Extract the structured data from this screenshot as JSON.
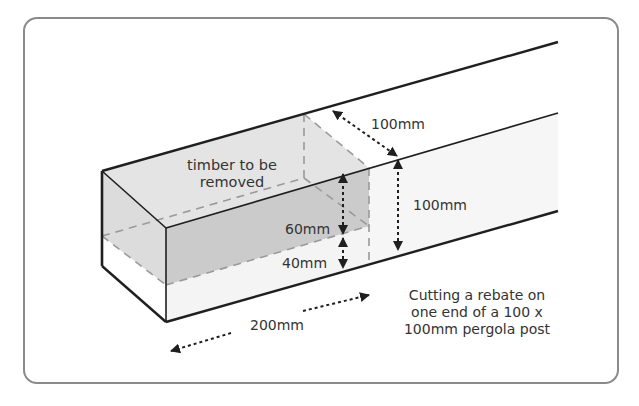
{
  "diagram": {
    "labels": {
      "removed": [
        "timber to be",
        "removed"
      ],
      "width_top": "100mm",
      "height_right": "100mm",
      "rebate_depth": "60mm",
      "remaining": "40mm",
      "length": "200mm"
    },
    "caption": [
      "Cutting a rebate on",
      "one end of a 100 x",
      "100mm pergola post"
    ],
    "colors": {
      "frame": "#8a8a8a",
      "outline": "#1f1f1f",
      "removed_top": "#e2e2e2",
      "removed_end": "#dadada",
      "removed_front": "#c8c8c8",
      "face_light": "#f4f4f4",
      "dashed": "#9a9a9a",
      "text": "#333333"
    }
  }
}
